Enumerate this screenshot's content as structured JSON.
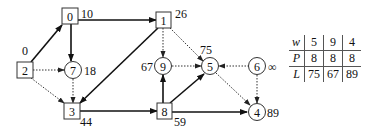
{
  "diagram": {
    "nodes": [
      {
        "id": "2",
        "shape": "box",
        "dist": "0"
      },
      {
        "id": "0",
        "shape": "box",
        "dist": "10"
      },
      {
        "id": "7",
        "shape": "circle",
        "dist": "18"
      },
      {
        "id": "3",
        "shape": "box",
        "dist": "44"
      },
      {
        "id": "1",
        "shape": "box",
        "dist": "26"
      },
      {
        "id": "9",
        "shape": "circle",
        "dist": "67"
      },
      {
        "id": "5",
        "shape": "circle",
        "dist": "75"
      },
      {
        "id": "6",
        "shape": "circle",
        "dist": "∞"
      },
      {
        "id": "8",
        "shape": "box",
        "dist": "59"
      },
      {
        "id": "4",
        "shape": "circle",
        "dist": "89"
      }
    ],
    "edges": [
      {
        "from": "2",
        "to": "0",
        "style": "solid"
      },
      {
        "from": "2",
        "to": "7",
        "style": "dotted"
      },
      {
        "from": "2",
        "to": "3",
        "style": "dotted"
      },
      {
        "from": "0",
        "to": "1",
        "style": "solid"
      },
      {
        "from": "0",
        "to": "7",
        "style": "solid"
      },
      {
        "from": "7",
        "to": "3",
        "style": "dotted"
      },
      {
        "from": "1",
        "to": "3",
        "style": "solid"
      },
      {
        "from": "1",
        "to": "9",
        "style": "dotted"
      },
      {
        "from": "1",
        "to": "5",
        "style": "dotted"
      },
      {
        "from": "3",
        "to": "8",
        "style": "solid"
      },
      {
        "from": "8",
        "to": "9",
        "style": "solid"
      },
      {
        "from": "8",
        "to": "5",
        "style": "solid"
      },
      {
        "from": "8",
        "to": "4",
        "style": "solid"
      },
      {
        "from": "9",
        "to": "5",
        "style": "dotted"
      },
      {
        "from": "6",
        "to": "5",
        "style": "dotted"
      },
      {
        "from": "6",
        "to": "4",
        "style": "dotted"
      },
      {
        "from": "5",
        "to": "4",
        "style": "dotted"
      }
    ]
  },
  "table": {
    "rows": [
      {
        "header": "w",
        "values": [
          "5",
          "9",
          "4"
        ]
      },
      {
        "header": "P",
        "values": [
          "8",
          "8",
          "8"
        ]
      },
      {
        "header": "L",
        "values": [
          "75",
          "67",
          "89"
        ]
      }
    ]
  }
}
